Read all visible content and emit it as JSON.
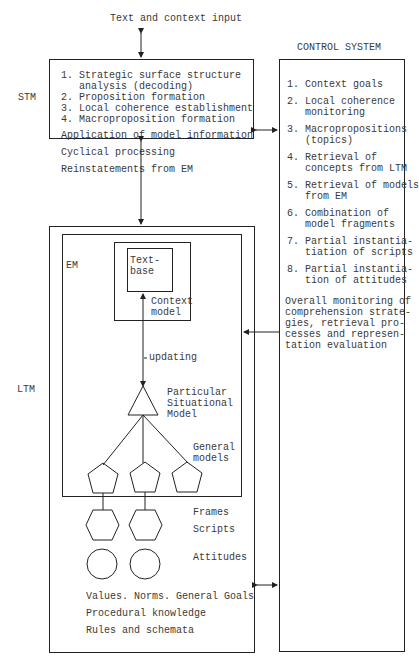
{
  "top_input": "Text and context input",
  "control_system": {
    "title": "CONTROL SYSTEM",
    "items": [
      [
        "1. Context goals"
      ],
      [
        "2. Local coherence",
        "   monitoring"
      ],
      [
        "3. Macropropositions",
        "   (topics)"
      ],
      [
        "4. Retrieval of",
        "   concepts from LTM"
      ],
      [
        "5. Retrieval of models",
        "   from EM"
      ],
      [
        "6. Combination of",
        "   model fragments"
      ],
      [
        "7. Partial instantia-",
        "   tiation of scripts"
      ],
      [
        "8. Partial instantia-",
        "   tion of attitudes"
      ]
    ],
    "overall": [
      "Overall monitoring of",
      "comprehension strate-",
      "gies, retrieval pro-",
      "cesses and represen-",
      "tation evaluation"
    ]
  },
  "stm": {
    "label": "STM",
    "steps": [
      "1. Strategic surface structure",
      "   analysis (decoding)",
      "2. Proposition formation",
      "3. Local coherence establishment",
      "4. Macroproposition formation"
    ],
    "application": "Application of model information",
    "cyclical": "Cyclical processing",
    "reinstatements": "Reinstatements from EM"
  },
  "ltm": {
    "label": "LTM",
    "em_label": "EM",
    "textbase": [
      "Text-",
      "base"
    ],
    "context_model": [
      "Context",
      "model"
    ],
    "updating": "updating",
    "situational_model": [
      "Particular",
      "Situational",
      "Model"
    ],
    "general_models": [
      "General",
      "models"
    ],
    "frames": "Frames",
    "scripts": "Scripts",
    "attitudes": "Attitudes",
    "values": "Values. Norms. General Goals",
    "procedural": "Procedural knowledge",
    "rules": "Rules and schemata"
  }
}
